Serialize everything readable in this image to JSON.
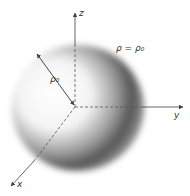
{
  "figure": {
    "equation_label": "ρ = ρ₀",
    "radius_label": "ρ₀",
    "axes": {
      "x": "x",
      "y": "y",
      "z": "z"
    },
    "colors": {
      "background": "#ffffff",
      "axis": "#444444",
      "shade_dark": "#3a3a3a",
      "shade_light": "#ffffff"
    }
  }
}
